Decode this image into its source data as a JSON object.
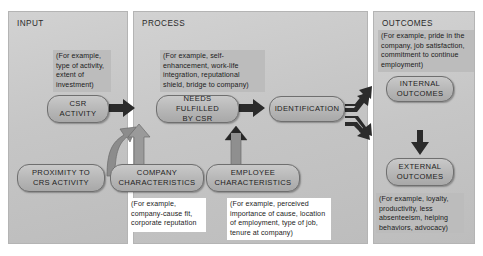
{
  "diagram": {
    "panels": [
      {
        "id": "input",
        "label": "INPUT"
      },
      {
        "id": "process",
        "label": "PROCESS"
      },
      {
        "id": "outcomes",
        "label": "OUTCOMES"
      }
    ],
    "nodes": [
      {
        "id": "csr-activity",
        "label": "CSR\nACTIVITY"
      },
      {
        "id": "needs-fulfilled",
        "label": "NEEDS FULFILLED\nBY CSR"
      },
      {
        "id": "identification",
        "label": "IDENTIFICATION"
      },
      {
        "id": "internal-outcomes",
        "label": "INTERNAL\nOUTCOMES"
      },
      {
        "id": "external-outcomes",
        "label": "EXTERNAL\nOUTCOMES"
      },
      {
        "id": "proximity",
        "label": "PROXIMITY TO\nCRS ACTIVITY"
      },
      {
        "id": "company-characteristics",
        "label": "COMPANY\nCHARACTERISTICS"
      },
      {
        "id": "employee-characteristics",
        "label": "EMPLOYEE\nCHARACTERISTICS"
      }
    ],
    "notes": [
      {
        "id": "note-csr-activity",
        "text": "(For example, type of activity, extent of investment)"
      },
      {
        "id": "note-needs-fulfilled",
        "text": "(For example, self-enhancement, work-life integration, reputational shield, bridge to company)"
      },
      {
        "id": "note-internal-outcomes",
        "text": "(For example, pride in the company, job satisfaction, commitment to continue employment)"
      },
      {
        "id": "note-external-outcomes",
        "text": "(For example, loyalty, productivity, less absenteeism, helping behaviors, advocacy)"
      },
      {
        "id": "note-company-characteristics",
        "text": "(For example, company-cause fit, corporate reputation"
      },
      {
        "id": "note-employee-characteristics",
        "text": "(For example, perceived importance of cause, location of employment, type of job, tenure at company)"
      }
    ],
    "node_labels": {
      "csr_activity_l1": "CSR",
      "csr_activity_l2": "ACTIVITY",
      "needs_l1": "NEEDS FULFILLED",
      "needs_l2": "BY CSR",
      "identification": "IDENTIFICATION",
      "internal_l1": "INTERNAL",
      "internal_l2": "OUTCOMES",
      "external_l1": "EXTERNAL",
      "external_l2": "OUTCOMES",
      "proximity_l1": "PROXIMITY TO",
      "proximity_l2": "CRS ACTIVITY",
      "company_l1": "COMPANY",
      "company_l2": "CHARACTERISTICS",
      "employee_l1": "EMPLOYEE",
      "employee_l2": "CHARACTERISTICS"
    },
    "arrows": [
      {
        "id": "csr-to-needs",
        "from": "csr-activity",
        "to": "needs-fulfilled",
        "style": "block-right"
      },
      {
        "id": "needs-to-identification",
        "from": "needs-fulfilled",
        "to": "identification",
        "style": "block-right"
      },
      {
        "id": "identification-to-internal",
        "from": "identification",
        "to": "internal-outcomes",
        "style": "block-curved-up"
      },
      {
        "id": "identification-to-external",
        "from": "identification",
        "to": "external-outcomes",
        "style": "block-curved-down"
      },
      {
        "id": "internal-to-external",
        "from": "internal-outcomes",
        "to": "external-outcomes",
        "style": "block-down"
      },
      {
        "id": "proximity-to-needs",
        "from": "proximity",
        "to": "needs-fulfilled",
        "style": "block-curved-up"
      },
      {
        "id": "company-to-needs",
        "from": "company-characteristics",
        "to": "needs-fulfilled",
        "style": "block-up"
      },
      {
        "id": "employee-to-identification",
        "from": "employee-characteristics",
        "to": "identification",
        "style": "block-up"
      }
    ],
    "colors": {
      "panel_fill": "#c8c8c8",
      "node_fill": "#b9b9b9",
      "node_stroke": "#6f6f6f",
      "note_fill": "#bcbcbc",
      "arrow_fill": "#2b2b2b",
      "text": "#1d1d1d",
      "background": "#ffffff"
    }
  }
}
